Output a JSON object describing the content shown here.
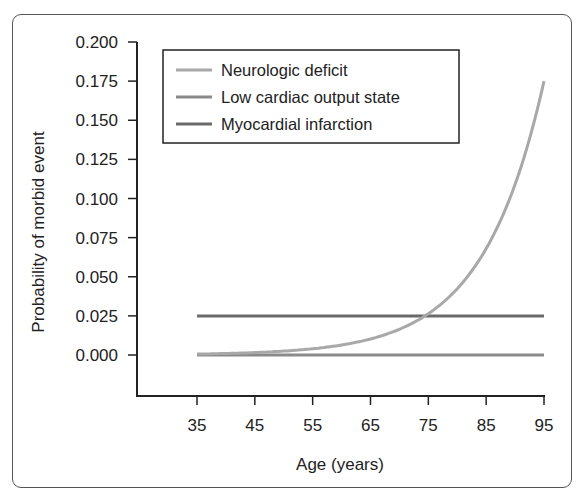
{
  "chart_data": {
    "type": "line",
    "title": "",
    "xlabel": "Age (years)",
    "ylabel": "Probability of morbid event",
    "xlim": [
      35,
      95
    ],
    "ylim": [
      0,
      0.2
    ],
    "x_ticks": [
      "35",
      "45",
      "55",
      "65",
      "75",
      "85",
      "95"
    ],
    "y_ticks": [
      "0.000",
      "0.025",
      "0.050",
      "0.075",
      "0.100",
      "0.125",
      "0.150",
      "0.175",
      "0.200"
    ],
    "grid": false,
    "legend_position": "upper left",
    "x": [
      35,
      45,
      55,
      65,
      75,
      85,
      95
    ],
    "series": [
      {
        "name": "Neurologic deficit",
        "color": "#a8a8a8",
        "values": [
          0.0006,
          0.0016,
          0.0041,
          0.0106,
          0.0269,
          0.0686,
          0.175
        ]
      },
      {
        "name": "Low cardiac output state",
        "color": "#8a8a8a",
        "values": [
          0.0,
          0.0,
          0.0,
          0.0,
          0.0,
          0.0,
          0.0
        ]
      },
      {
        "name": "Myocardial infarction",
        "color": "#6a6a6a",
        "values": [
          0.025,
          0.025,
          0.025,
          0.025,
          0.025,
          0.025,
          0.025
        ]
      }
    ]
  }
}
